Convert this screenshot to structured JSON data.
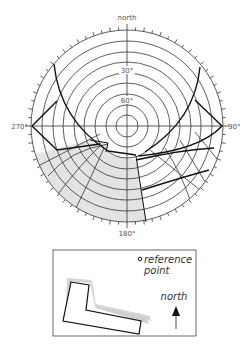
{
  "chart_data": {
    "type": "polar-obstruction-diagram",
    "title": "",
    "center_px": [
      127,
      126
    ],
    "outer_radius_px": 96,
    "altitude_rings_deg": [
      0,
      10,
      20,
      30,
      40,
      50,
      60,
      70,
      80
    ],
    "altitude_labels": [
      {
        "text": "30°",
        "altitude": 30
      },
      {
        "text": "60°",
        "altitude": 60
      }
    ],
    "azimuth_labels": [
      {
        "text": "north",
        "azimuth": 0
      },
      {
        "text": "90°",
        "azimuth": 90
      },
      {
        "text": "180°",
        "azimuth": 180
      },
      {
        "text": "270°",
        "azimuth": 270
      }
    ],
    "tick_spacing_deg": 5,
    "radial_lines_deg": [
      0,
      90,
      180,
      270
    ],
    "shaded_region": "obstruction mask lower-left quadrant (≈180°–245° azimuth, altitude 0°–~45°)",
    "colors": {
      "grid": "#333333",
      "heavy_line": "#111111",
      "shade": "#e2e2e2",
      "label": "#555555"
    }
  },
  "diagram": {
    "labels": {
      "north": "north",
      "east": "90°",
      "south": "180°",
      "west": "270°",
      "alt30": "30°",
      "alt60": "60°"
    }
  },
  "legend": {
    "reference_line1": "reference",
    "reference_line2": "point",
    "north_label": "north"
  }
}
